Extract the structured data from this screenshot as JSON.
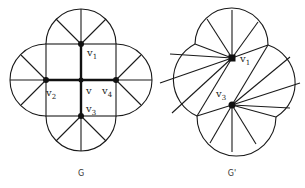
{
  "figure": {
    "graphs": [
      {
        "id": "G",
        "caption": "G",
        "vertex_labels": {
          "v": "v",
          "v1": "v",
          "v1_sub": "1",
          "v2": "v",
          "v2_sub": "2",
          "v3": "v",
          "v3_sub": "3",
          "v4": "v",
          "v4_sub": "4"
        },
        "description": "Square with cross (bold edges v-v1, v-v2, v-v3, v-v4); four semicircular lobes on each side, each subdivided by spokes from its midpoint vertex"
      },
      {
        "id": "G'",
        "caption": "G'",
        "vertex_labels": {
          "v1": "v",
          "v1_sub": "1",
          "v3": "v",
          "v3_sub": "3"
        },
        "description": "Four-lobed outline with fan triangulations from v1 and v3"
      }
    ],
    "colors": {
      "stroke": "#1a1a1a",
      "background": "#ffffff"
    }
  }
}
